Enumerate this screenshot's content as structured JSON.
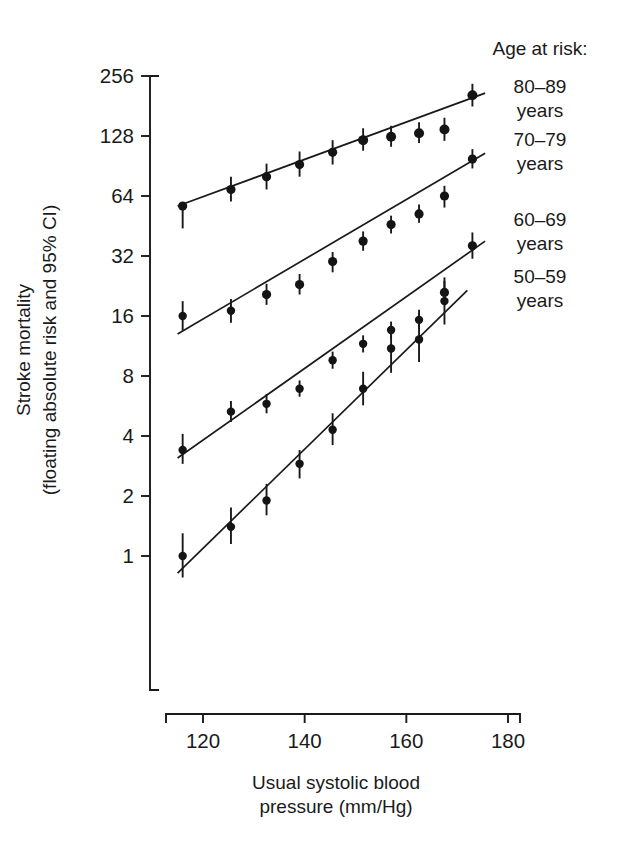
{
  "chart_data": {
    "type": "scatter",
    "title": "",
    "xlabel": "Usual systolic blood pressure (mm/Hg)",
    "xlabel_line1": "Usual systolic blood",
    "xlabel_line2": "pressure (mm/Hg)",
    "ylabel": "Stroke mortality (floating absolute risk and 95% CI)",
    "ylabel_line1": "Stroke mortality",
    "ylabel_line2": "(floating absolute risk and 95% CI)",
    "yscale": "log2",
    "ylim": [
      0.7,
      300
    ],
    "xlim": [
      112,
      186
    ],
    "yticks": [
      1,
      2,
      4,
      8,
      16,
      32,
      64,
      128,
      256
    ],
    "ytick_labels": [
      "1",
      "2",
      "4",
      "8",
      "16",
      "32",
      "64",
      "128",
      "256"
    ],
    "xticks": [
      120,
      140,
      160,
      180
    ],
    "xtick_labels": [
      "120",
      "140",
      "160",
      "180"
    ],
    "grid": false,
    "legend_position": "right",
    "legend_title": "Age at risk:",
    "series": [
      {
        "name": "80-89 years",
        "label_line1": "80–89",
        "label_line2": "years",
        "x": [
          116.0,
          125.5,
          132.5,
          139.0,
          145.5,
          151.5,
          157.0,
          162.5,
          167.5,
          173.0
        ],
        "y": [
          57.0,
          69.0,
          80.0,
          92.0,
          106.0,
          122.0,
          127.0,
          132.0,
          138.0,
          205.0
        ],
        "y_low": [
          44.0,
          60.0,
          69.0,
          80.0,
          92.0,
          108.0,
          113.0,
          118.0,
          121.0,
          180.0
        ],
        "y_high": [
          57.0,
          80.0,
          93.0,
          107.0,
          122.0,
          140.0,
          144.0,
          150.0,
          158.0,
          234.0
        ],
        "fit_x": [
          115.0,
          175.5
        ],
        "fit_y": [
          57.0,
          210.0
        ]
      },
      {
        "name": "70-79 years",
        "label_line1": "70–79",
        "label_line2": "years",
        "x": [
          116.0,
          125.5,
          132.5,
          139.0,
          145.5,
          151.5,
          157.0,
          162.5,
          167.5,
          173.0
        ],
        "y": [
          16.0,
          17.0,
          20.5,
          23.0,
          30.0,
          38.0,
          46.0,
          52.0,
          64.0,
          98.0
        ],
        "y_low": [
          13.5,
          14.8,
          18.2,
          20.5,
          26.5,
          34.0,
          41.5,
          47.0,
          56.0,
          88.0
        ],
        "y_high": [
          19.0,
          19.5,
          23.2,
          26.0,
          33.5,
          42.5,
          51.0,
          58.0,
          72.0,
          110.0
        ],
        "fit_x": [
          115.0,
          175.5
        ],
        "fit_y": [
          13.0,
          105.0
        ]
      },
      {
        "name": "60-69 years",
        "label_line1": "60–69",
        "label_line2": "years",
        "x": [
          116.0,
          125.5,
          132.5,
          139.0,
          145.5,
          151.5,
          157.0,
          162.5,
          167.5,
          173.0
        ],
        "y": [
          3.4,
          5.3,
          5.8,
          6.9,
          9.6,
          11.6,
          13.6,
          15.3,
          21.0,
          36.0
        ],
        "y_low": [
          2.9,
          4.7,
          5.2,
          6.3,
          8.7,
          10.5,
          12.3,
          13.7,
          18.5,
          31.0
        ],
        "y_high": [
          4.1,
          6.0,
          6.5,
          7.6,
          10.6,
          12.8,
          15.0,
          17.2,
          24.0,
          42.0
        ],
        "fit_x": [
          115.0,
          175.5
        ],
        "fit_y": [
          3.1,
          38.0
        ]
      },
      {
        "name": "50-59 years",
        "label_line1": "50–59",
        "label_line2": "years",
        "x": [
          116.0,
          125.5,
          132.5,
          139.0,
          145.5,
          151.5,
          157.0,
          162.5,
          167.5
        ],
        "y": [
          1.0,
          1.4,
          1.9,
          2.9,
          4.3,
          6.9,
          11.0,
          12.2,
          19.0
        ],
        "y_low": [
          0.78,
          1.15,
          1.6,
          2.45,
          3.6,
          5.7,
          8.3,
          9.4,
          14.5
        ],
        "y_high": [
          1.3,
          1.75,
          2.3,
          3.4,
          5.2,
          8.4,
          14.2,
          16.4,
          25.0
        ],
        "fit_x": [
          115.0,
          172.0
        ],
        "fit_y": [
          0.82,
          21.5
        ]
      }
    ]
  },
  "legend": {
    "title": "Age at risk:",
    "entries": [
      {
        "line1": "80–89",
        "line2": "years"
      },
      {
        "line1": "70–79",
        "line2": "years"
      },
      {
        "line1": "60–69",
        "line2": "years"
      },
      {
        "line1": "50–59",
        "line2": "years"
      }
    ]
  },
  "axes": {
    "y_title_line1": "Stroke mortality",
    "y_title_line2": "(floating absolute risk and 95% CI)",
    "x_title_line1": "Usual systolic blood",
    "x_title_line2": "pressure (mm/Hg)"
  },
  "colors": {
    "ink": "#1a1a1a",
    "background": "#ffffff"
  }
}
